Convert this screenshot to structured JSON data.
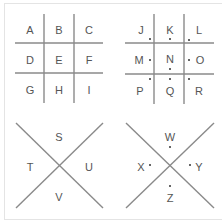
{
  "colors": {
    "line": "#8a8a8a",
    "text": "#555555",
    "dot": "#333333"
  },
  "panels": [
    {
      "id": "grid-plain",
      "type": "tic-tac-toe-grid",
      "dots": false,
      "letters": [
        "A",
        "B",
        "C",
        "D",
        "E",
        "F",
        "G",
        "H",
        "I"
      ]
    },
    {
      "id": "grid-dotted",
      "type": "tic-tac-toe-grid",
      "dots": true,
      "letters": [
        "J",
        "K",
        "L",
        "M",
        "N",
        "O",
        "P",
        "Q",
        "R"
      ]
    },
    {
      "id": "x-plain",
      "type": "x-shape",
      "dots": false,
      "letters": {
        "top": "S",
        "left": "T",
        "right": "U",
        "bottom": "V"
      }
    },
    {
      "id": "x-dotted",
      "type": "x-shape",
      "dots": true,
      "letters": {
        "top": "W",
        "left": "X",
        "right": "Y",
        "bottom": "Z"
      }
    }
  ]
}
